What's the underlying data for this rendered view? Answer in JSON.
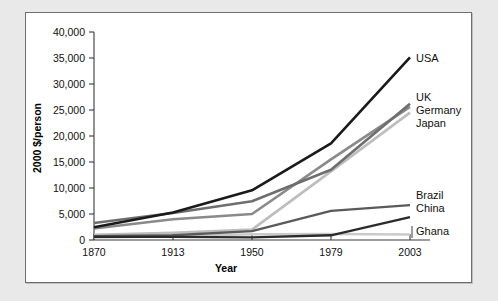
{
  "chart_data": {
    "type": "line",
    "title": "",
    "xlabel": "Year",
    "ylabel": "2000 $/person",
    "categories": [
      "1870",
      "1913",
      "1950",
      "1979",
      "2003"
    ],
    "x": [
      1870,
      1913,
      1950,
      1979,
      2003
    ],
    "xlim": [
      1870,
      2003
    ],
    "ylim": [
      0,
      40000
    ],
    "yticks": [
      "0",
      "5,000",
      "10,000",
      "15,000",
      "20,000",
      "25,000",
      "30,000",
      "35,000",
      "40,000"
    ],
    "ytick_values": [
      0,
      5000,
      10000,
      15000,
      20000,
      25000,
      30000,
      35000,
      40000
    ],
    "grid": false,
    "legend_position": "right-inline-labels",
    "series": [
      {
        "name": "USA",
        "color": "#1a1a1a",
        "width": 2.6,
        "values": [
          2450,
          5300,
          9560,
          18600,
          35100
        ]
      },
      {
        "name": "UK",
        "color": "#6e6e6e",
        "width": 2.6,
        "values": [
          3260,
          5200,
          7450,
          13500,
          26200
        ]
      },
      {
        "name": "Germany",
        "color": "#8a8a8a",
        "width": 2.6,
        "values": [
          2200,
          4000,
          5000,
          15500,
          25600
        ]
      },
      {
        "name": "Japan",
        "color": "#bdbdbd",
        "width": 2.6,
        "values": [
          1000,
          1400,
          2000,
          13200,
          24500
        ]
      },
      {
        "name": "Brazil",
        "color": "#5a5a5a",
        "width": 2.4,
        "values": [
          750,
          900,
          1700,
          5600,
          6700
        ]
      },
      {
        "name": "China",
        "color": "#2b2b2b",
        "width": 2.4,
        "values": [
          600,
          600,
          500,
          900,
          4400
        ]
      },
      {
        "name": "Ghana",
        "color": "#cacaca",
        "width": 2.4,
        "values": [
          450,
          700,
          1100,
          1150,
          1050
        ]
      }
    ],
    "annotations": [
      {
        "text": "USA",
        "series": "USA",
        "value": 35100
      },
      {
        "text": "UK",
        "series": "UK",
        "value": 26200
      },
      {
        "text": "Germany",
        "series": "Germany",
        "value": 25600
      },
      {
        "text": "Japan",
        "series": "Japan",
        "value": 24500
      },
      {
        "text": "Brazil",
        "series": "Brazil",
        "value": 6700
      },
      {
        "text": "China",
        "series": "China",
        "value": 4400
      },
      {
        "text": "Ghana",
        "series": "Ghana",
        "value": 1050
      }
    ]
  },
  "axes": {
    "y_title": "2000 $/person",
    "x_title": "Year"
  },
  "colors": {
    "page_background": "#e9e9e9",
    "plot_background": "#ffffff",
    "frame_border": "#6b6f73",
    "axis": "#3a3a3a",
    "text": "#111111"
  }
}
